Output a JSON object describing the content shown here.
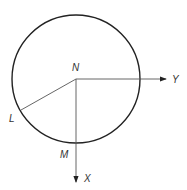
{
  "diagram": {
    "labels": {
      "center": "N",
      "left_point": "L",
      "bottom_point": "M",
      "x_axis": "X",
      "y_axis": "Y"
    },
    "circle": {
      "cx": 76,
      "cy": 79,
      "r": 64
    },
    "colors": {
      "circle": "#222222",
      "lines": "#555555"
    }
  }
}
